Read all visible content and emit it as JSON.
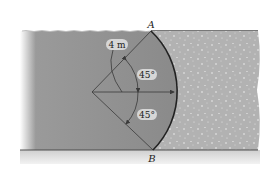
{
  "diagram": {
    "points": {
      "top_label": "A",
      "bottom_label": "B"
    },
    "dimensions": {
      "radius_label": "4 m",
      "angle_upper_label": "45°",
      "angle_lower_label": "45°"
    },
    "regions": {
      "water": "water",
      "soil": "soil",
      "ground": "ground"
    },
    "colors": {
      "water": "#8e8e8e",
      "soil": "#b4b4b4",
      "ground": "#d9d9d9",
      "line": "#3a3a3a",
      "label_bubble": "#d6d6d6"
    }
  }
}
